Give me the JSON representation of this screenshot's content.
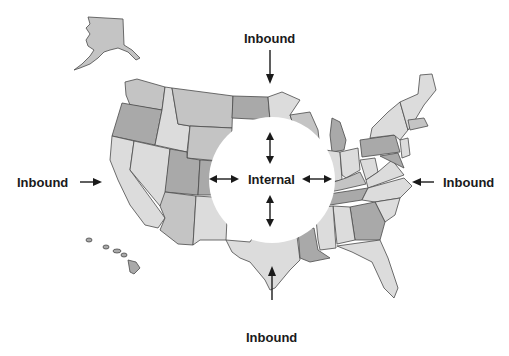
{
  "labels": {
    "top": "Inbound",
    "left": "Inbound",
    "right": "Inbound",
    "bottom": "Inbound",
    "center": "Internal"
  },
  "colors": {
    "light": "#dcdcdc",
    "medium": "#c4c4c4",
    "dark": "#a9a9a9",
    "border": "#4a4a4a",
    "text": "#1a1a1a"
  }
}
